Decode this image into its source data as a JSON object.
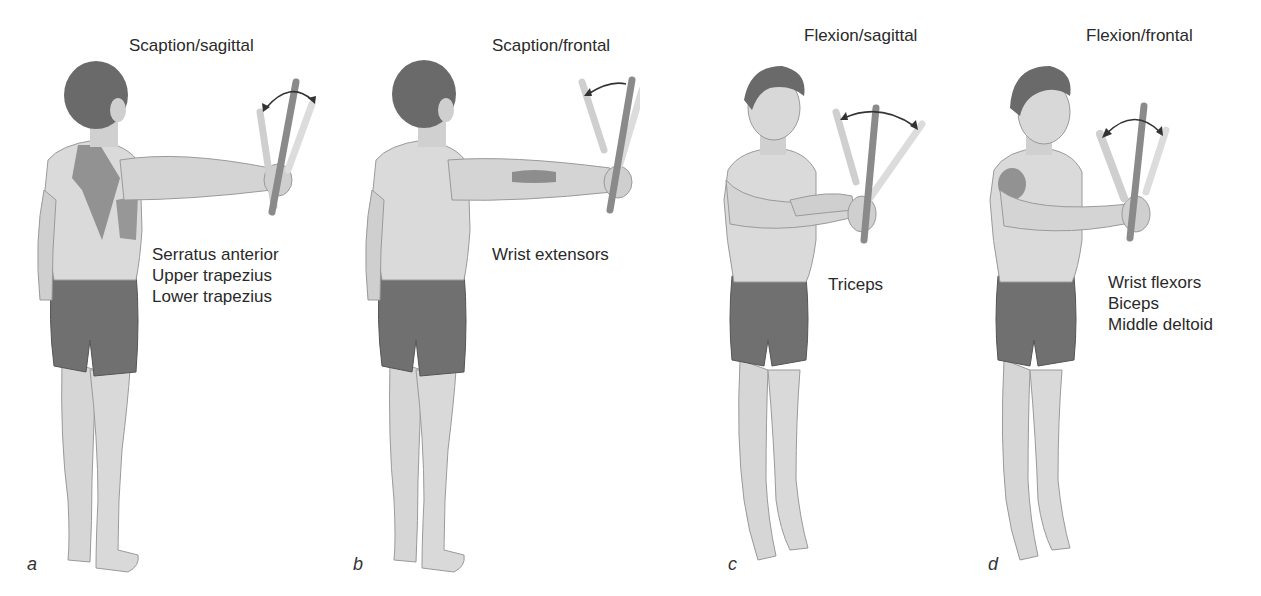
{
  "figure": {
    "panels": [
      {
        "letter": "a",
        "title": "Scaption/sagittal",
        "view": "back-view",
        "muscles": [
          "Serratus anterior",
          "Upper trapezius",
          "Lower trapezius"
        ]
      },
      {
        "letter": "b",
        "title": "Scaption/frontal",
        "view": "back-view",
        "muscles": [
          "Wrist extensors"
        ]
      },
      {
        "letter": "c",
        "title": "Flexion/sagittal",
        "view": "front-view",
        "muscles": [
          "Triceps"
        ]
      },
      {
        "letter": "d",
        "title": "Flexion/frontal",
        "view": "front-view",
        "muscles": [
          "Wrist flexors",
          "Biceps",
          "Middle deltoid"
        ]
      }
    ],
    "colors": {
      "background": "#ffffff",
      "skin": "#d9d9d9",
      "skin_shadow": "#a8a8a8",
      "hair": "#6a6a6a",
      "shorts": "#707070",
      "highlight_muscle": "#7a7a7a",
      "stick": "#8a8a8a",
      "stick_ghost": "#cfcfcf",
      "text": "#2a2a2a"
    }
  }
}
